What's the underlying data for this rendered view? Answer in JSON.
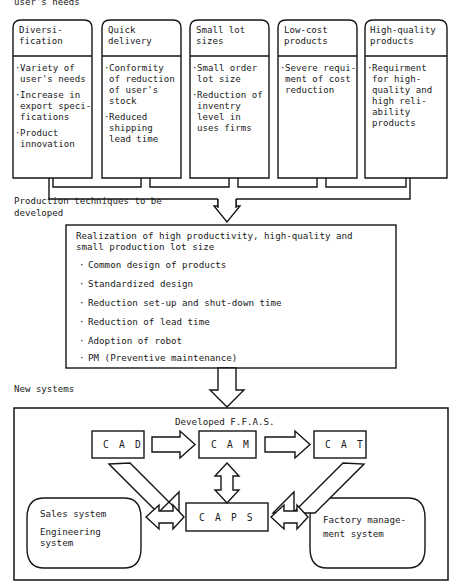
{
  "figure": {
    "top_note": "user's needs",
    "caption_mid": "Production techniques to be\ndeveloped",
    "caption_mid_line1": "Production techniques to be",
    "caption_mid_line2": "developed",
    "caption_bottom": "New systems"
  },
  "needs_cards": [
    {
      "title_line1": "Diversi-",
      "title_line2": "fication",
      "bullets": [
        [
          "Variety of",
          "user's needs"
        ],
        [
          "Increase in",
          "export speci-",
          "fications"
        ],
        [
          "Product",
          "innovation"
        ]
      ]
    },
    {
      "title_line1": "Quick",
      "title_line2": "delivery",
      "bullets": [
        [
          "Conformity",
          "of reduction",
          "of user's",
          "stock"
        ],
        [
          "Reduced",
          "shipping",
          "lead time"
        ]
      ]
    },
    {
      "title_line1": "Small lot",
      "title_line2": "sizes",
      "bullets": [
        [
          "Small order",
          "lot size"
        ],
        [
          "Reduction of",
          "inventry",
          "level in",
          "uses firms"
        ]
      ]
    },
    {
      "title_line1": "Low-cost",
      "title_line2": "products",
      "bullets": [
        [
          "Severe requi-",
          "ment of cost",
          "reduction"
        ]
      ]
    },
    {
      "title_line1": "High-quality",
      "title_line2": "products",
      "bullets": [
        [
          "Requirment",
          "for high-",
          "quality and",
          "high reli-",
          "ability",
          "products"
        ]
      ]
    }
  ],
  "techniques_box": {
    "heading_line1": "Realization of high productivity, high-quality and",
    "heading_line2": "small production lot size",
    "items": [
      "Common design of products",
      "Standardized design",
      "Reduction set-up and shut-down time",
      "Reduction of lead time",
      "Adoption of robot",
      "PM (Preventive maintenance)"
    ]
  },
  "systems_box": {
    "title": "Developed F.F.A.S.",
    "nodes": {
      "cad": "C A D",
      "cam": "C A M",
      "cat": "C A T",
      "caps": "C A P S"
    },
    "pods": {
      "left_line1": "Sales system",
      "left_line2": "Engineering",
      "left_line3": "system",
      "right_line1": "Factory manage-",
      "right_line2": "ment system"
    }
  },
  "icons": {
    "arrow_down_bus": "arrow-down-hollow-icon",
    "arrow_down_mid": "arrow-down-hollow-icon",
    "arrow_right_cad_cam": "arrow-right-hollow-icon",
    "arrow_right_cam_cat": "arrow-right-hollow-icon",
    "arrow_updown_cam_caps": "arrow-updown-hollow-icon",
    "arrow_diag_cad_caps": "arrow-diagonal-hollow-icon",
    "arrow_diag_caps_cat": "arrow-diagonal-hollow-icon",
    "arrow_lr_sales_caps": "arrow-leftright-hollow-icon",
    "arrow_lr_caps_factory": "arrow-leftright-hollow-icon"
  },
  "colors": {
    "ink": "#151515",
    "paper": "#ffffff"
  }
}
